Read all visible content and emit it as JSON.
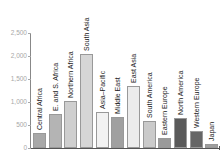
{
  "chart_data": {
    "type": "bar",
    "title": "",
    "xlabel": "",
    "ylabel": "",
    "ylim": [
      0,
      2500
    ],
    "yticks": [
      "0",
      "500",
      "1,000",
      "1,500",
      "2,000",
      "2,500"
    ],
    "grid": false,
    "legend": null,
    "labels_inside_bars_rotated": true,
    "categories": [
      "Central Africa",
      "E. and S. Africa",
      "Northern Africa",
      "South Asia",
      "Asia–Pacific",
      "Middle East",
      "East Asia",
      "South America",
      "Eastern Europe",
      "North America",
      "Western Europe",
      "Japan"
    ],
    "values": [
      320,
      730,
      1025,
      2050,
      780,
      680,
      1355,
      590,
      210,
      650,
      380,
      80
    ],
    "colors": [
      "#a8a8a8",
      "#b4b4b4",
      "#cfcfcf",
      "#d6d6d6",
      "#f2f2f2",
      "#a0a0a0",
      "#ececec",
      "#cacaca",
      "#9a9a9a",
      "#5a5a5a",
      "#666666",
      "#9e9e9e"
    ]
  }
}
